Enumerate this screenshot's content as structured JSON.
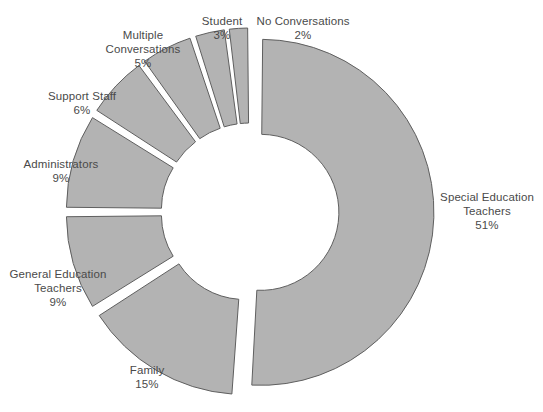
{
  "chart_data": {
    "type": "pie",
    "variant": "doughnut-exploded",
    "title": "",
    "subtitle": "",
    "xlabel": "",
    "ylabel": "",
    "legend": "none",
    "grid": false,
    "units": "percent",
    "total": 100,
    "start_angle_deg": 0,
    "direction": "clockwise",
    "inner_radius_ratio": 0.45,
    "categories": [
      "Special Education Teachers",
      "Family",
      "General Education Teachers",
      "Administrators",
      "Support Staff",
      "Multiple Conversations",
      "Student",
      "No Conversations"
    ],
    "values": [
      51,
      15,
      9,
      9,
      6,
      5,
      3,
      2
    ],
    "value_labels": [
      "51%",
      "15%",
      "9%",
      "9%",
      "6%",
      "5%",
      "3%",
      "2%"
    ],
    "slices": [
      {
        "name": "Special Education Teachers",
        "label_line1": "Special Education",
        "label_line2": "Teachers",
        "value": 51,
        "percent_label": "51%",
        "color": "#b3b3b3",
        "start_pct": 0,
        "end_pct": 51,
        "exploded": true
      },
      {
        "name": "Family",
        "label_line1": "Family",
        "label_line2": "",
        "value": 15,
        "percent_label": "15%",
        "color": "#b3b3b3",
        "start_pct": 51,
        "end_pct": 66,
        "exploded": true
      },
      {
        "name": "General Education Teachers",
        "label_line1": "General Education",
        "label_line2": "Teachers",
        "value": 9,
        "percent_label": "9%",
        "color": "#b3b3b3",
        "start_pct": 66,
        "end_pct": 75,
        "exploded": true
      },
      {
        "name": "Administrators",
        "label_line1": "Administrators",
        "label_line2": "",
        "value": 9,
        "percent_label": "9%",
        "color": "#b3b3b3",
        "start_pct": 75,
        "end_pct": 84,
        "exploded": true
      },
      {
        "name": "Support Staff",
        "label_line1": "Support Staff",
        "label_line2": "",
        "value": 6,
        "percent_label": "6%",
        "color": "#b3b3b3",
        "start_pct": 84,
        "end_pct": 90,
        "exploded": true
      },
      {
        "name": "Multiple Conversations",
        "label_line1": "Multiple",
        "label_line2": "Conversations",
        "value": 5,
        "percent_label": "5%",
        "color": "#b3b3b3",
        "start_pct": 90,
        "end_pct": 95,
        "exploded": true
      },
      {
        "name": "Student",
        "label_line1": "Student",
        "label_line2": "",
        "value": 3,
        "percent_label": "3%",
        "color": "#b3b3b3",
        "start_pct": 95,
        "end_pct": 98,
        "exploded": true
      },
      {
        "name": "No Conversations",
        "label_line1": "No Conversations",
        "label_line2": "",
        "value": 2,
        "percent_label": "2%",
        "color": "#b3b3b3",
        "start_pct": 98,
        "end_pct": 100,
        "exploded": true
      }
    ],
    "style": {
      "background": "#ffffff",
      "slice_fill": "#b3b3b3",
      "slice_stroke": "#5f5f5f",
      "text_color": "#4a4a4a"
    }
  },
  "labels": {
    "special_education_teachers": {
      "line1": "Special Education",
      "line2": "Teachers",
      "pct": "51%"
    },
    "family": {
      "line1": "Family",
      "line2": "",
      "pct": "15%"
    },
    "general_education_teachers": {
      "line1": "General Education",
      "line2": "Teachers",
      "pct": "9%"
    },
    "administrators": {
      "line1": "Administrators",
      "line2": "",
      "pct": "9%"
    },
    "support_staff": {
      "line1": "Support Staff",
      "line2": "",
      "pct": "6%"
    },
    "multiple_conversations": {
      "line1": "Multiple",
      "line2": "Conversations",
      "pct": "5%"
    },
    "student": {
      "line1": "Student",
      "line2": "",
      "pct": "3%"
    },
    "no_conversations": {
      "line1": "No Conversations",
      "line2": "",
      "pct": "2%"
    }
  }
}
